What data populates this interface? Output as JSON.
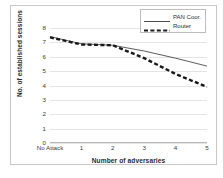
{
  "chart_data": {
    "type": "line",
    "title": "",
    "xlabel": "Number of adversaries",
    "ylabel": "No. of established sessions",
    "categories": [
      "No Attack",
      "1",
      "2",
      "3",
      "4",
      "5"
    ],
    "ylim": [
      0,
      8
    ],
    "yticks": [
      "0",
      "1",
      "2",
      "3",
      "4",
      "5",
      "6",
      "7",
      "8"
    ],
    "grid": true,
    "legend_position": "top-right",
    "series": [
      {
        "name": "PAN Coor.",
        "style": "solid",
        "color": "#4a4a4a",
        "values": [
          7.4,
          6.9,
          6.8,
          6.4,
          5.9,
          5.35
        ]
      },
      {
        "name": "Router",
        "style": "dashed",
        "color": "#1a1a1a",
        "values": [
          7.35,
          6.85,
          6.8,
          5.9,
          4.8,
          3.9
        ]
      }
    ]
  },
  "legend": {
    "items": [
      {
        "label": "PAN Coor."
      },
      {
        "label": "Router"
      }
    ]
  }
}
